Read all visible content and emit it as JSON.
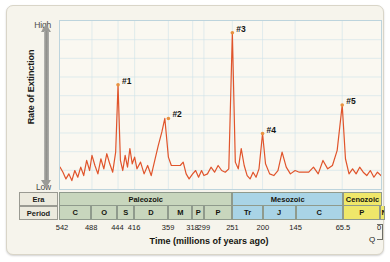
{
  "figure": {
    "background_color": "#f6f4ec",
    "plot_background_color": "#faf8f1",
    "line_color": "#e0542b",
    "grid_color": "#cfe2ea"
  },
  "yaxis": {
    "top_label": "High",
    "bottom_label": "Low",
    "title": "Rate of Extinction",
    "arrow_icon": "double-arrow-vertical-icon"
  },
  "xaxis": {
    "title": "Time (millions of years ago)",
    "tick_labels": [
      "542",
      "488",
      "444",
      "416",
      "359",
      "318",
      "299",
      "251",
      "200",
      "145",
      "65.5",
      "0"
    ],
    "tick_values": [
      542,
      488,
      444,
      416,
      359,
      318,
      299,
      251,
      200,
      145,
      65.5,
      0
    ],
    "quaternary_label": "Q"
  },
  "geo_table": {
    "row_labels": {
      "era": "Era",
      "period": "Period"
    },
    "eras": [
      {
        "name": "Paleozoic",
        "start": 542,
        "end": 251,
        "color": "#c8d6bd"
      },
      {
        "name": "Mesozoic",
        "start": 251,
        "end": 65.5,
        "color": "#a9d4e6"
      },
      {
        "name": "Cenozoic",
        "start": 65.5,
        "end": 0,
        "color": "#efe76a"
      }
    ],
    "periods": [
      {
        "label": "C",
        "start": 542,
        "end": 488,
        "era": "Paleozoic"
      },
      {
        "label": "O",
        "start": 488,
        "end": 444,
        "era": "Paleozoic"
      },
      {
        "label": "S",
        "start": 444,
        "end": 416,
        "era": "Paleozoic"
      },
      {
        "label": "D",
        "start": 416,
        "end": 359,
        "era": "Paleozoic"
      },
      {
        "label": "M",
        "start": 359,
        "end": 318,
        "era": "Paleozoic"
      },
      {
        "label": "P",
        "start": 318,
        "end": 299,
        "era": "Paleozoic"
      },
      {
        "label": "P",
        "start": 299,
        "end": 251,
        "era": "Paleozoic"
      },
      {
        "label": "Tr",
        "start": 251,
        "end": 200,
        "era": "Mesozoic"
      },
      {
        "label": "J",
        "start": 200,
        "end": 145,
        "era": "Mesozoic"
      },
      {
        "label": "C",
        "start": 145,
        "end": 65.5,
        "era": "Mesozoic"
      },
      {
        "label": "P",
        "start": 65.5,
        "end": 2.6,
        "era": "Cenozoic"
      },
      {
        "label": "N",
        "start": 2.6,
        "end": 0,
        "era": "Cenozoic"
      }
    ]
  },
  "chart_data": {
    "type": "line",
    "title": "",
    "xlabel": "Time (millions of years ago)",
    "ylabel": "Rate of Extinction",
    "xlim": [
      542,
      0
    ],
    "ylim": [
      0,
      100
    ],
    "x_inverted": true,
    "grid": true,
    "legend": null,
    "annotations": [
      {
        "label": "#1",
        "x": 444,
        "y": 62
      },
      {
        "label": "#2",
        "x": 359,
        "y": 42
      },
      {
        "label": "#3",
        "x": 251,
        "y": 93
      },
      {
        "label": "#4",
        "x": 200,
        "y": 33
      },
      {
        "label": "#5",
        "x": 65.5,
        "y": 50
      }
    ],
    "series": [
      {
        "name": "Extinction rate",
        "x": [
          542,
          537,
          532,
          527,
          522,
          517,
          512,
          507,
          502,
          497,
          492,
          488,
          483,
          478,
          473,
          468,
          463,
          458,
          453,
          448,
          444,
          440,
          436,
          432,
          428,
          424,
          420,
          416,
          412,
          406,
          400,
          394,
          388,
          382,
          376,
          370,
          365,
          359,
          354,
          349,
          344,
          339,
          334,
          329,
          324,
          318,
          313,
          308,
          303,
          299,
          293,
          287,
          281,
          275,
          269,
          263,
          257,
          251,
          246,
          241,
          236,
          231,
          226,
          221,
          216,
          211,
          206,
          200,
          195,
          188,
          181,
          174,
          167,
          160,
          153,
          145,
          138,
          130,
          122,
          114,
          106,
          98,
          90,
          82,
          74,
          65.5,
          60,
          54,
          48,
          42,
          36,
          30,
          24,
          18,
          12,
          6,
          0
        ],
        "y": [
          13,
          10,
          6,
          9,
          5,
          11,
          7,
          13,
          8,
          17,
          11,
          20,
          14,
          9,
          18,
          12,
          21,
          15,
          10,
          22,
          62,
          17,
          11,
          20,
          13,
          24,
          15,
          19,
          12,
          16,
          9,
          14,
          8,
          17,
          26,
          34,
          42,
          19,
          14,
          14,
          14,
          14,
          16,
          9,
          6,
          9,
          11,
          7,
          11,
          8,
          9,
          13,
          10,
          14,
          11,
          10,
          12,
          93,
          16,
          12,
          24,
          14,
          8,
          6,
          10,
          7,
          12,
          33,
          15,
          9,
          8,
          11,
          22,
          13,
          9,
          11,
          10,
          10,
          10,
          13,
          9,
          17,
          12,
          14,
          23,
          50,
          18,
          9,
          12,
          9,
          13,
          10,
          8,
          11,
          7,
          10,
          8
        ]
      }
    ]
  }
}
